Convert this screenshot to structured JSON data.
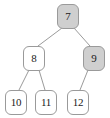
{
  "figure": {
    "kind": "binary-tree-diagram",
    "width": 110,
    "height": 118,
    "background_color": "#ffffff"
  },
  "style": {
    "node_fill_plain": "#ffffff",
    "node_fill_shaded": "#cfcfcf",
    "node_border_color": "#9a9a9a",
    "edge_color": "#8f8f8f",
    "text_color": "#1a1a1a"
  },
  "tree": {
    "root_id": "n7",
    "nodes": [
      {
        "id": "n7",
        "label": "7",
        "shaded": true,
        "level": 0,
        "x": 68,
        "y": 16,
        "width": 22,
        "height": 25
      },
      {
        "id": "n8",
        "label": "8",
        "shaded": false,
        "level": 1,
        "x": 34,
        "y": 58,
        "width": 22,
        "height": 25
      },
      {
        "id": "n9",
        "label": "9",
        "shaded": true,
        "level": 1,
        "x": 94,
        "y": 58,
        "width": 22,
        "height": 25
      },
      {
        "id": "n10",
        "label": "10",
        "shaded": false,
        "level": 2,
        "x": 16,
        "y": 102,
        "width": 22,
        "height": 25
      },
      {
        "id": "n11",
        "label": "11",
        "shaded": false,
        "level": 2,
        "x": 46,
        "y": 102,
        "width": 22,
        "height": 25
      },
      {
        "id": "n12",
        "label": "12",
        "shaded": false,
        "level": 2,
        "x": 78,
        "y": 102,
        "width": 22,
        "height": 25
      }
    ],
    "edges": [
      {
        "id": "e7-8",
        "from": "n7",
        "to": "n8",
        "x1": 62,
        "y1": 28,
        "x2": 38,
        "y2": 46
      },
      {
        "id": "e7-9",
        "from": "n7",
        "to": "n9",
        "x1": 74,
        "y1": 28,
        "x2": 90,
        "y2": 46
      },
      {
        "id": "e8-10",
        "from": "n8",
        "to": "n10",
        "x1": 29,
        "y1": 70,
        "x2": 19,
        "y2": 90
      },
      {
        "id": "e8-11",
        "from": "n8",
        "to": "n11",
        "x1": 39,
        "y1": 70,
        "x2": 45,
        "y2": 90
      },
      {
        "id": "e9-12",
        "from": "n9",
        "to": "n12",
        "x1": 88,
        "y1": 70,
        "x2": 80,
        "y2": 90
      }
    ]
  }
}
